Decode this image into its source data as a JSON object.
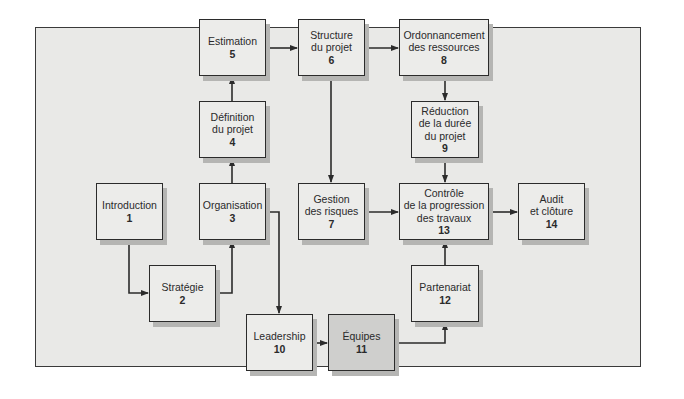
{
  "diagram": {
    "nodes": [
      {
        "id": 1,
        "label_lines": [
          "Introduction"
        ],
        "number": "1"
      },
      {
        "id": 2,
        "label_lines": [
          "Stratégie"
        ],
        "number": "2"
      },
      {
        "id": 3,
        "label_lines": [
          "Organisation"
        ],
        "number": "3"
      },
      {
        "id": 4,
        "label_lines": [
          "Définition",
          "du projet"
        ],
        "number": "4"
      },
      {
        "id": 5,
        "label_lines": [
          "Estimation"
        ],
        "number": "5"
      },
      {
        "id": 6,
        "label_lines": [
          "Structure",
          "du projet"
        ],
        "number": "6"
      },
      {
        "id": 7,
        "label_lines": [
          "Gestion",
          "des risques"
        ],
        "number": "7"
      },
      {
        "id": 8,
        "label_lines": [
          "Ordonnancement",
          "des ressources"
        ],
        "number": "8"
      },
      {
        "id": 9,
        "label_lines": [
          "Réduction",
          "de la durée",
          "du projet"
        ],
        "number": "9"
      },
      {
        "id": 10,
        "label_lines": [
          "Leadership"
        ],
        "number": "10"
      },
      {
        "id": 11,
        "label_lines": [
          "Équipes"
        ],
        "number": "11",
        "highlighted": true
      },
      {
        "id": 12,
        "label_lines": [
          "Partenariat"
        ],
        "number": "12"
      },
      {
        "id": 13,
        "label_lines": [
          "Contrôle",
          "de la progression",
          "des travaux"
        ],
        "number": "13"
      },
      {
        "id": 14,
        "label_lines": [
          "Audit",
          "et clôture"
        ],
        "number": "14"
      }
    ],
    "edges": [
      {
        "from": 1,
        "to": 2
      },
      {
        "from": 2,
        "to": 3
      },
      {
        "from": 3,
        "to": 4
      },
      {
        "from": 4,
        "to": 5
      },
      {
        "from": 5,
        "to": 6
      },
      {
        "from": 6,
        "to": 8
      },
      {
        "from": 6,
        "to": 7
      },
      {
        "from": 8,
        "to": 9
      },
      {
        "from": 9,
        "to": 13
      },
      {
        "from": 7,
        "to": 13
      },
      {
        "from": 13,
        "to": 14
      },
      {
        "from": 3,
        "to": 10
      },
      {
        "from": 10,
        "to": 11
      },
      {
        "from": 11,
        "to": 12
      },
      {
        "from": 12,
        "to": 13
      }
    ],
    "colors": {
      "panel": "#e9e9e7",
      "box": "#ececea",
      "box_highlight": "#cfcfcd",
      "border": "#2b2b2b",
      "shadow": "#b5b5b3"
    }
  }
}
